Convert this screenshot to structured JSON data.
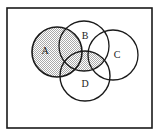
{
  "figure": {
    "kind": "venn-diagram",
    "background_color": "#ffffff",
    "stroke_color": "#1a1a1a",
    "shade_color": "#c9c9c9",
    "shade_pattern": "50-percent-dither-checkerboard"
  },
  "universe": {
    "name": "universal-set-rectangle",
    "x": 7,
    "y": 8,
    "width": 145,
    "height": 120,
    "stroke_width": 1.6
  },
  "sets": [
    {
      "id": "A",
      "label": "A",
      "cx": 57,
      "cy": 52,
      "r": 25,
      "label_x": 45,
      "label_y": 52,
      "shaded": true,
      "stroke_width": 1.6
    },
    {
      "id": "B",
      "label": "B",
      "cx": 84,
      "cy": 46,
      "r": 25,
      "label_x": 85,
      "label_y": 37,
      "shaded": false,
      "stroke_width": 1.3
    },
    {
      "id": "C",
      "label": "C",
      "cx": 113,
      "cy": 55,
      "r": 25,
      "label_x": 117,
      "label_y": 56,
      "shaded": false,
      "stroke_width": 1.3
    },
    {
      "id": "D",
      "label": "D",
      "cx": 85,
      "cy": 76,
      "r": 25,
      "label_x": 85,
      "label_y": 85,
      "shaded": false,
      "stroke_width": 1.4
    }
  ],
  "shaded_regions": [
    {
      "id": "region-A",
      "description": "entire set A disc",
      "fill": "#c9c9c9"
    },
    {
      "id": "region-BD-center",
      "description": "central overlap of B and D",
      "fill": "#c9c9c9"
    }
  ]
}
